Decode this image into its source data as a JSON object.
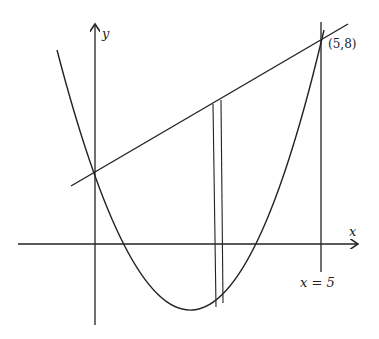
{
  "diagram": {
    "type": "function-graph",
    "axes": {
      "x_label": "x",
      "y_label": "y"
    },
    "point_label": "(5,8)",
    "vertical_line_label": "x = 5",
    "colors": {
      "ink": "#222222",
      "background": "#ffffff"
    }
  }
}
